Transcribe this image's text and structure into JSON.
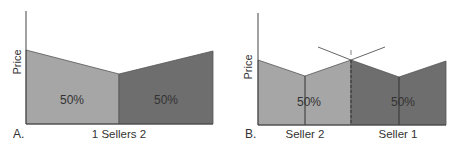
{
  "panels": [
    {
      "id": "A",
      "letter": "A.",
      "ylabel": "Price",
      "xlabel": "1 Sellers 2",
      "regions": [
        {
          "name": "seller-1-share",
          "label": "50%",
          "color": "#a6a6a6"
        },
        {
          "name": "seller-2-share",
          "label": "50%",
          "color": "#6e6e6e"
        }
      ]
    },
    {
      "id": "B",
      "letter": "B.",
      "ylabel": "Price",
      "xlabel_left": "Seller 2",
      "xlabel_right": "Seller 1",
      "regions": [
        {
          "name": "seller-2-share",
          "label": "50%",
          "color": "#a6a6a6"
        },
        {
          "name": "seller-1-share",
          "label": "50%",
          "color": "#6e6e6e"
        }
      ]
    }
  ],
  "colors": {
    "light_region": "#a6a6a6",
    "dark_region": "#6e6e6e",
    "axis": "#333333",
    "text": "#333333"
  }
}
